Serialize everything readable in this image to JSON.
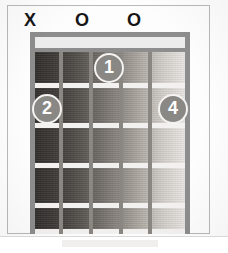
{
  "diagram": {
    "type": "guitar-chord-diagram",
    "instrument": "guitar",
    "string_count": 6,
    "fret_count": 5,
    "open_muted_markers": [
      {
        "string": 1,
        "symbol": "X",
        "meaning": "muted",
        "x": 30
      },
      {
        "string": 3,
        "symbol": "O",
        "meaning": "open",
        "x": 82
      },
      {
        "string": 5,
        "symbol": "O",
        "meaning": "open",
        "x": 134
      }
    ],
    "finger_positions": [
      {
        "label": "1",
        "string": 4,
        "fret": 1,
        "x": 109,
        "y": 53
      },
      {
        "label": "2",
        "string": 2,
        "fret": 2,
        "x": 47,
        "y": 94
      },
      {
        "label": "4",
        "string": 6,
        "fret": 2,
        "x": 173,
        "y": 94
      }
    ],
    "colors": {
      "nut": "#8d8d8d",
      "string": "#8a8681",
      "fret": "#f2f1ef",
      "dot_fill": "#8a8885",
      "dot_ring": "#f4f3f1",
      "dot_text": "#ffffff",
      "marker_text": "#161616",
      "frame": "#b9b9b9",
      "page": "#fdfdfd"
    }
  }
}
